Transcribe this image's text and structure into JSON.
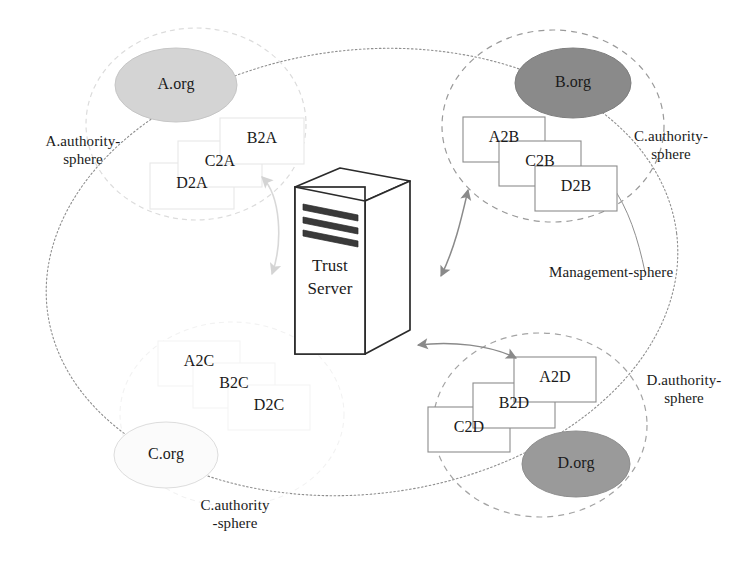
{
  "figure": {
    "canvas": {
      "width": 749,
      "height": 572
    },
    "background": "#ffffff"
  },
  "colors": {
    "ink": "#1a1a1a",
    "management_sphere_stroke": "#8f8f8f",
    "authority_sphere_stroke_strong": "#9a9a9a",
    "authority_sphere_stroke_faint": "#dcdcdc",
    "org_fill_a": "#d4d4d4",
    "org_fill_b": "#8a8a8a",
    "org_fill_c": "#fbfbfb",
    "org_fill_d": "#9a9a9a",
    "card_stroke_strong": "#8c8c8c",
    "card_stroke_faint": "#e8e8e8",
    "card_fill": "#ffffff",
    "server_stroke": "#2b2b2b",
    "server_fill": "#ffffff",
    "arrow_strong": "#8a8a8a",
    "arrow_faint": "#d8d8d8"
  },
  "management_sphere": {
    "label": "Management-sphere",
    "leader_line": true,
    "stroke_style": "dotted-solid"
  },
  "server": {
    "label_line1": "Trust",
    "label_line2": "Server",
    "name": "Trust Server",
    "slot_count": 3
  },
  "spheres": [
    {
      "id": "a",
      "label_line1": "A.authority-",
      "label_line2": "sphere",
      "label": "A.authority-sphere",
      "org_label": "A.org",
      "cards": [
        "B2A",
        "C2A",
        "D2A"
      ],
      "cascade": "down-left",
      "emphasis": "faint"
    },
    {
      "id": "b",
      "label_line1": "C.authority-",
      "label_line2": "sphere",
      "label": "C.authority-sphere",
      "org_label": "B.org",
      "cards": [
        "A2B",
        "C2B",
        "D2B"
      ],
      "cascade": "down-right",
      "emphasis": "strong"
    },
    {
      "id": "c",
      "label_line1": "C.authority",
      "label_line2": "-sphere",
      "label": "C.authority-sphere",
      "org_label": "C.org",
      "cards": [
        "A2C",
        "B2C",
        "D2C"
      ],
      "cascade": "down-right",
      "emphasis": "faint"
    },
    {
      "id": "d",
      "label_line1": "D.authority-",
      "label_line2": "sphere",
      "label": "D.authority-sphere",
      "org_label": "D.org",
      "cards": [
        "A2D",
        "B2D",
        "C2D"
      ],
      "cascade": "down-left",
      "emphasis": "strong"
    }
  ],
  "connections": [
    {
      "id": "a-server",
      "from": "A.authority-sphere",
      "to": "Trust Server",
      "style": "double-headed-curved",
      "emphasis": "faint"
    },
    {
      "id": "b-server",
      "from": "C.authority-sphere",
      "to": "Trust Server",
      "style": "double-headed-curved",
      "emphasis": "strong"
    },
    {
      "id": "d-server",
      "from": "D.authority-sphere",
      "to": "Trust Server",
      "style": "double-headed-curved",
      "emphasis": "strong"
    }
  ]
}
